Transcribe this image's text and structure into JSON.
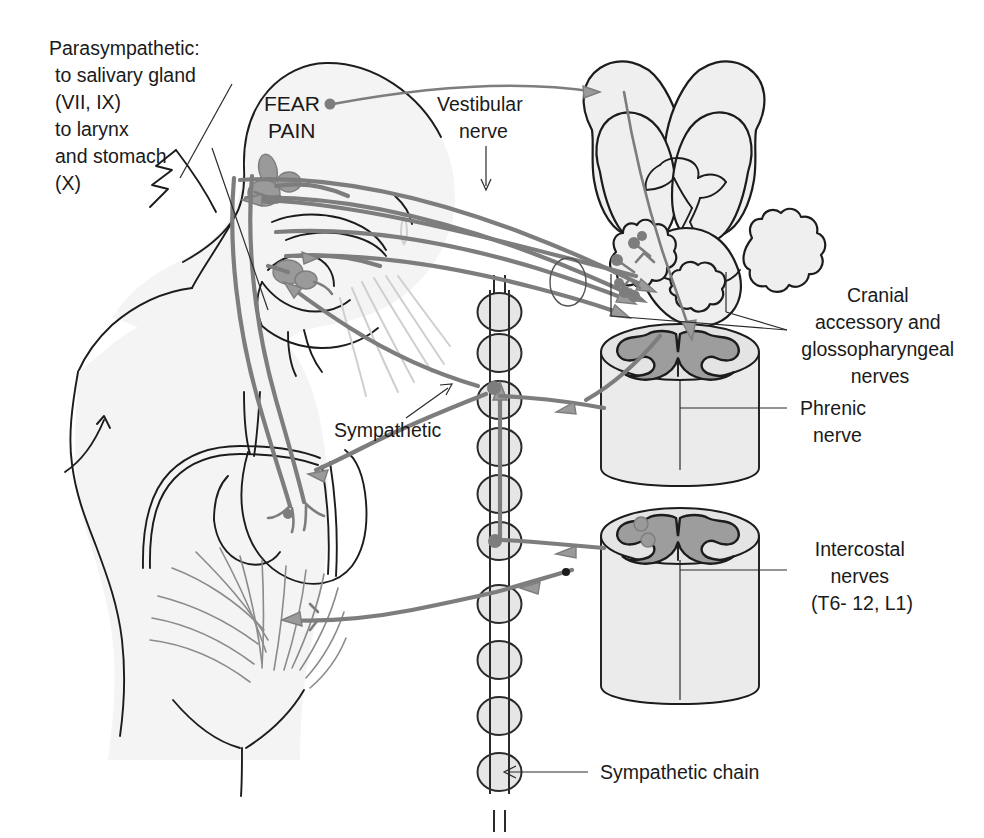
{
  "figure": {
    "background_color": "#ffffff",
    "ink_color": "#1c1c1c",
    "nerve_color": "#7d7d7d",
    "gray_matter_color": "#9d9d9d",
    "organ_fill_color": "#f4f4f4"
  },
  "labels": {
    "parasympathetic": {
      "line1": "Parasympathetic:",
      "line2": "to salivary gland",
      "line3": "(VII, IX)",
      "line4": "to larynx",
      "line5": "and stomach",
      "line6": "(X)"
    },
    "fear_pain": {
      "line1": "FEAR",
      "line2": "PAIN"
    },
    "vestibular_nerve": {
      "line1": "Vestibular",
      "line2": "nerve"
    },
    "cranial_accessory": {
      "line1": "Cranial",
      "line2": "accessory and",
      "line3": "glossopharyngeal",
      "line4": "nerves"
    },
    "phrenic_nerve": {
      "line1": "Phrenic",
      "line2": "nerve"
    },
    "sympathetic": {
      "line1": "Sympathetic"
    },
    "intercostal_nerves": {
      "line1": "Intercostal",
      "line2": "nerves",
      "line3": "(T6- 12, L1)"
    },
    "sympathetic_chain": {
      "line1": "Sympathetic chain"
    }
  },
  "anatomy": {
    "parts": [
      "head-and-neck-outline",
      "torso-outline",
      "salivary-gland",
      "larynx-pharynx",
      "stomach",
      "abdominal-muscles",
      "brain-superior-view",
      "cerebellum",
      "brainstem",
      "spinal-cord-upper-segment",
      "spinal-cord-lower-segment",
      "sympathetic-chain-ganglia",
      "vomitus-stream",
      "uvula"
    ],
    "sympathetic_chain_ganglia_count": 9
  }
}
